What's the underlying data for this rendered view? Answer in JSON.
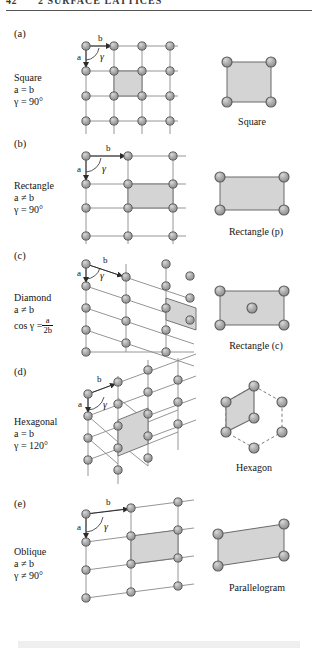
{
  "header": {
    "folio": "42",
    "title": "2  SURFACE LATTICES"
  },
  "colors": {
    "atom_fill": "#a8a8a8",
    "atom_stroke": "#5a5a5a",
    "atom_highlight": "#d6d6d6",
    "bond": "#8a8a8a",
    "shade": "#d4d4d4",
    "shade_stroke": "#6a6a6a",
    "text": "#141414",
    "rule": "#555555"
  },
  "rows": [
    {
      "tag": "(a)",
      "caption": [
        "Square",
        "a = b",
        "γ = 90°"
      ],
      "vector_a": "a",
      "vector_b": "b",
      "angle": "γ",
      "cell_name": "Square",
      "lattice_type": "square",
      "cell_type": "square",
      "centered": false
    },
    {
      "tag": "(b)",
      "caption": [
        "Rectangle",
        "a ≠ b",
        "γ = 90°"
      ],
      "vector_a": "a",
      "vector_b": "b",
      "angle": "γ",
      "cell_name": "Rectangle (p)",
      "lattice_type": "rectangle",
      "cell_type": "rectangle",
      "centered": false
    },
    {
      "tag": "(c)",
      "caption_line1": "Diamond",
      "caption_line2": "a ≠ b",
      "caption_line3_prefix": "cos γ =",
      "caption_frac_num": "a",
      "caption_frac_den": "2b",
      "vector_a": "a",
      "vector_b": "b",
      "angle": "γ",
      "cell_name": "Rectangle (c)",
      "lattice_type": "diamond",
      "cell_type": "rectangle-centered",
      "centered": true
    },
    {
      "tag": "(d)",
      "caption": [
        "Hexagonal",
        "a = b",
        "γ = 120°"
      ],
      "vector_a": "a",
      "vector_b": "b",
      "angle": "γ",
      "cell_name": "Hexagon",
      "lattice_type": "hexagonal",
      "cell_type": "hexagon",
      "centered": false
    },
    {
      "tag": "(e)",
      "caption": [
        "Oblique",
        "a ≠ b",
        "γ ≠ 90°"
      ],
      "vector_a": "a",
      "vector_b": "b",
      "angle": "γ",
      "cell_name": "Parallelogram",
      "lattice_type": "oblique",
      "cell_type": "parallelogram",
      "centered": false
    }
  ]
}
